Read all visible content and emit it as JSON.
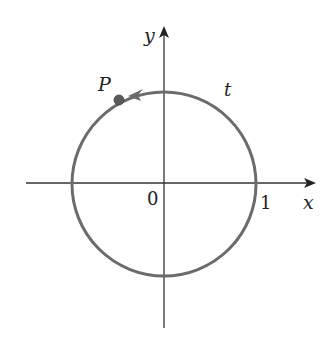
{
  "diagram": {
    "type": "unit-circle",
    "labels": {
      "x_axis": "x",
      "y_axis": "y",
      "origin": "0",
      "x_intercept": "1",
      "point": "P",
      "arc": "t"
    },
    "colors": {
      "circle": "#6b6b6b",
      "axes": "#333333",
      "point": "#5a5a5a",
      "text": "#222222"
    }
  }
}
